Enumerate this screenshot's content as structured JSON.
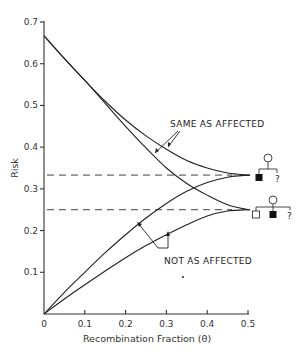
{
  "chart_data": {
    "type": "line",
    "title": "",
    "xlabel": "Recombination Fraction (θ)",
    "ylabel": "Risk",
    "xlim": [
      0,
      0.5
    ],
    "ylim": [
      0,
      0.7
    ],
    "grid": false,
    "x_ticks": [
      "0",
      "0.1",
      "0.2",
      "0.3",
      "0.4",
      "0.5"
    ],
    "y_ticks": [
      "0.1",
      "0.2",
      "0.3",
      "0.4",
      "0.5",
      "0.6",
      "0.7"
    ],
    "x": [
      0,
      0.05,
      0.1,
      0.15,
      0.2,
      0.25,
      0.3,
      0.35,
      0.4,
      0.45,
      0.5
    ],
    "series": [
      {
        "name": "Same as affected (pedigree 1)",
        "values": [
          0.667,
          0.612,
          0.56,
          0.51,
          0.465,
          0.427,
          0.395,
          0.368,
          0.35,
          0.338,
          0.333
        ]
      },
      {
        "name": "Same as affected (pedigree 2)",
        "values": [
          0.667,
          0.612,
          0.56,
          0.505,
          0.45,
          0.398,
          0.35,
          0.313,
          0.285,
          0.262,
          0.25
        ]
      },
      {
        "name": "Not as affected (pedigree 1)",
        "values": [
          0,
          0.052,
          0.1,
          0.147,
          0.19,
          0.23,
          0.265,
          0.294,
          0.315,
          0.328,
          0.333
        ]
      },
      {
        "name": "Not as affected (pedigree 2)",
        "values": [
          0,
          0.036,
          0.07,
          0.103,
          0.135,
          0.164,
          0.19,
          0.214,
          0.235,
          0.247,
          0.25
        ]
      }
    ],
    "reference_lines": [
      {
        "type": "horizontal",
        "y": 0.333,
        "style": "dashed"
      },
      {
        "type": "horizontal",
        "y": 0.25,
        "style": "dashed"
      }
    ],
    "annotations": [
      {
        "text": "SAME AS AFFECTED",
        "points_to": [
          "Same as affected (pedigree 1)",
          "Same as affected (pedigree 2)"
        ]
      },
      {
        "text": "NOT AS AFFECTED",
        "points_to": [
          "Not as affected (pedigree 1)",
          "Not as affected (pedigree 2)"
        ]
      }
    ],
    "pedigrees": [
      {
        "level": 0.333,
        "mother": "circle",
        "children": [
          "affected-square",
          "?"
        ]
      },
      {
        "level": 0.25,
        "mother": "circle",
        "children": [
          "unaffected-square",
          "affected-square",
          "?"
        ]
      }
    ]
  },
  "labels": {
    "x_axis_title": "Recombination Fraction (θ)",
    "y_axis_title": "Risk",
    "annotation_same": "SAME AS AFFECTED",
    "annotation_not": "NOT AS AFFECTED",
    "question_mark": "?"
  },
  "colors": {
    "ink": "#222222",
    "background": "#ffffff"
  }
}
